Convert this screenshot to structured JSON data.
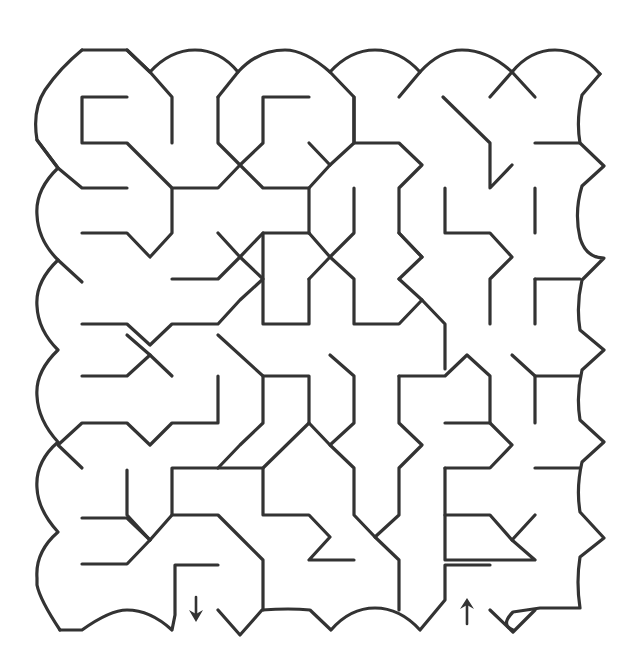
{
  "puzzle": {
    "type": "maze",
    "title": "",
    "entrance_label": "Start (arrow pointing down into maze)",
    "exit_label": "Finish (arrow pointing up out of maze)",
    "wall_color": "#333333",
    "background_color": "#ffffff"
  },
  "markers": {
    "start": {
      "icon": "down-arrow-icon",
      "x": 196,
      "y": 598
    },
    "end": {
      "icon": "up-arrow-icon",
      "x": 467,
      "y": 605
    }
  }
}
